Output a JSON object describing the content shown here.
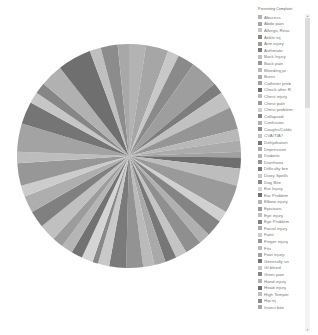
{
  "chart_data": {
    "type": "pie",
    "title": "",
    "legend_title": "Presenting Complaint",
    "legend_position": "right",
    "categories": [
      "Abscess",
      "Abdo pain",
      "Allergic Reac",
      "Ankle inj",
      "Arm injury",
      "Asthmatic",
      "Back Injury",
      "Back pain",
      "Bleeding pr",
      "Burns",
      "Catheter prob",
      "Check after R",
      "Chest injury",
      "Chest pain",
      "Chest problem",
      "Collapsed",
      "Confusion",
      "Coughs/Colds",
      "CVA/TIA?",
      "Dehydration",
      "Depression",
      "Diabetic",
      "Diarrhoea",
      "Difficulty bre",
      "Dizzy Spells",
      "Dog Bite",
      "Ear Injury",
      "Ear Problem",
      "Elbow injury",
      "Epistaxis",
      "Eye injury",
      "Eye Problem",
      "Facial injury",
      "Faint",
      "Finger injury",
      "Fits",
      "Foot injury",
      "Generally un",
      "GI bleed",
      "Groin pain",
      "Hand injury",
      "Head injury",
      "High Temper",
      "Hip inj",
      "Insect bite"
    ],
    "values": [
      3,
      4,
      2,
      3,
      5,
      2,
      3,
      4,
      2,
      2,
      1,
      2,
      3,
      5,
      2,
      3,
      2,
      3,
      2,
      2,
      2,
      2,
      3,
      3,
      2,
      1,
      2,
      2,
      2,
      2,
      3,
      3,
      3,
      2,
      4,
      2,
      5,
      4,
      2,
      2,
      4,
      6,
      2,
      3,
      2
    ],
    "colors": [
      "#b3b3b3",
      "#a6a6a6",
      "#c8c8c8",
      "#8a8a8a",
      "#9e9e9e",
      "#7d7d7d",
      "#c1c1c1",
      "#959595",
      "#b8b8b8",
      "#ababab",
      "#a1a1a1",
      "#6e6e6e",
      "#bdbdbd",
      "#9a9a9a",
      "#d0d0d0",
      "#848484",
      "#b0b0b0",
      "#8f8f8f",
      "#c4c4c4",
      "#777777",
      "#a9a9a9",
      "#bababa",
      "#939393",
      "#7a7a7a",
      "#c9c9c9",
      "#888888",
      "#d4d4d4",
      "#727272",
      "#b5b5b5",
      "#9c9c9c",
      "#c0c0c0",
      "#808080",
      "#aeaeae",
      "#cccccc",
      "#979797",
      "#bdbdbd",
      "#a3a3a3",
      "#757575",
      "#c6c6c6",
      "#868686",
      "#b1b1b1",
      "#6f6f6f",
      "#bfbfbf",
      "#8c8c8c",
      "#a8a8a8"
    ]
  },
  "legend": {
    "title": "Presenting Complaint",
    "scroll_up_icon": "▲",
    "scroll_down_icon": "▼"
  }
}
